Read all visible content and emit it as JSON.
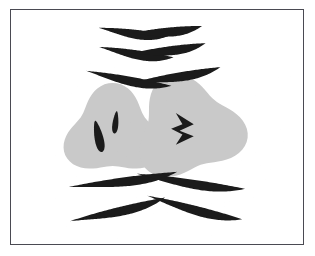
{
  "figure": {
    "kind": "line-art-mathematical-surface",
    "caption": "",
    "background_color": "#ffffff",
    "line_color": "#1b1b1b",
    "border_color": "#4a4a52",
    "shade_light": "#c9c9c9",
    "shade_mid": "#9a9a9a",
    "shade_dark": "#1b1b1b"
  },
  "frame": {
    "x": 10,
    "y": 9,
    "width": 294,
    "height": 236,
    "stroke_width": 1.5
  },
  "chart_data": {
    "type": "line",
    "xlabel": "",
    "ylabel": "",
    "xlim": [
      -1.55,
      1.55
    ],
    "ylim": [
      -1.25,
      1.25
    ],
    "grid": true,
    "legend": false,
    "mapping": {
      "u_samples": 150,
      "v_samples": 130,
      "u_lines": 46,
      "v_lines": 40,
      "base_radius": 1.42,
      "swirl_strength": 1.05,
      "fold_gain": 0.62
    },
    "vortices": [
      {
        "name": "left-vortex",
        "center_x": -0.47,
        "center_y": 0.06,
        "radius": 0.46,
        "circulation": 1.0,
        "turns": 2.6,
        "handedness": "clockwise"
      },
      {
        "name": "right-vortex",
        "center_x": 0.33,
        "center_y": 0.02,
        "radius": 0.52,
        "circulation": -1.15,
        "turns": 3.0,
        "handedness": "counter-clockwise"
      }
    ],
    "cusps": [
      {
        "name": "top-left-cusp",
        "x": -0.42,
        "y": 0.88,
        "width": 0.52,
        "angle": -14
      },
      {
        "name": "top-right-cusp",
        "x": 0.4,
        "y": 0.86,
        "width": 0.52,
        "angle": 14
      },
      {
        "name": "upper-band-left",
        "x": -0.36,
        "y": 0.56,
        "width": 0.58,
        "angle": -8
      },
      {
        "name": "upper-band-right",
        "x": 0.36,
        "y": 0.58,
        "width": 0.58,
        "angle": 8
      },
      {
        "name": "lower-left-cusp",
        "x": -0.3,
        "y": -0.52,
        "width": 0.46,
        "angle": 10
      },
      {
        "name": "lower-right-cusp",
        "x": 0.22,
        "y": -0.56,
        "width": 0.46,
        "angle": -10
      },
      {
        "name": "bottom-left-wing",
        "x": -0.22,
        "y": -0.8,
        "width": 0.4,
        "angle": 8
      },
      {
        "name": "bottom-right-wing",
        "x": 0.12,
        "y": -0.84,
        "width": 0.4,
        "angle": -8
      },
      {
        "name": "bottom-outer-left",
        "x": -0.24,
        "y": -1.02,
        "width": 0.38,
        "angle": 6
      },
      {
        "name": "bottom-outer-right",
        "x": 0.1,
        "y": -1.04,
        "width": 0.38,
        "angle": -6
      }
    ],
    "dark_marks": [
      {
        "name": "left-eye-mark",
        "x": -0.62,
        "y": 0.1,
        "rx": 0.045,
        "ry": 0.17,
        "angle": -12
      },
      {
        "name": "left-inner-mark",
        "x": -0.44,
        "y": -0.05,
        "rx": 0.03,
        "ry": 0.12,
        "angle": 6
      },
      {
        "name": "right-zigzag",
        "x": 0.22,
        "y": 0.02,
        "rx": 0.16,
        "ry": 0.18,
        "angle": 0
      }
    ]
  }
}
